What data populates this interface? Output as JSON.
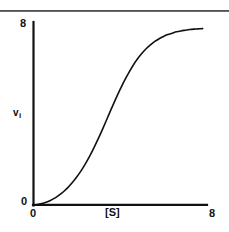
{
  "figure": {
    "background": "#ffffff",
    "ink": "#111111",
    "rule_color": "#6b6b6b"
  },
  "top_rule": {
    "name": "page-rule"
  },
  "axes": {
    "x_label": "[S]",
    "y_label_base": "v",
    "y_label_sub": "i",
    "x_tick_min": "0",
    "x_tick_max": "8",
    "y_tick_min": "0",
    "y_tick_max": "8",
    "origin_label": "0"
  },
  "chart_data": {
    "type": "line",
    "title": "",
    "subtitle": "",
    "xlabel": "[S]",
    "ylabel": "v_i",
    "xlim": [
      0,
      8
    ],
    "ylim": [
      0,
      8
    ],
    "xticks": [
      0,
      8
    ],
    "yticks": [
      0,
      8
    ],
    "xticklabels": [
      "0",
      "8"
    ],
    "yticklabels": [
      "0",
      "8"
    ],
    "grid": false,
    "legend": null,
    "legend_position": "none",
    "annotations": [],
    "series": [
      {
        "name": "sigmoidal velocity curve",
        "color": "#111111",
        "line_width": 1.6,
        "marker": "none",
        "description": "S-shaped (sigmoidal) cooperative saturation curve rising from the origin, inflecting near [S]=4, plateauing near v=7.7",
        "x": [
          0.0,
          0.2,
          0.4,
          0.6,
          0.8,
          1.0,
          1.2,
          1.4,
          1.6,
          1.8,
          2.0,
          2.2,
          2.4,
          2.6,
          2.8,
          3.0,
          3.2,
          3.4,
          3.6,
          3.8,
          4.0,
          4.2,
          4.4,
          4.6,
          4.8,
          5.0,
          5.2,
          5.4,
          5.6,
          5.8,
          6.0,
          6.2,
          6.4,
          6.6,
          6.8,
          7.0,
          7.2,
          7.4,
          7.6,
          7.8
        ],
        "y": [
          0.0,
          0.02,
          0.06,
          0.12,
          0.2,
          0.3,
          0.43,
          0.58,
          0.76,
          0.97,
          1.21,
          1.48,
          1.79,
          2.13,
          2.5,
          2.9,
          3.32,
          3.76,
          4.2,
          4.63,
          5.04,
          5.43,
          5.78,
          6.1,
          6.38,
          6.62,
          6.83,
          7.0,
          7.15,
          7.27,
          7.37,
          7.45,
          7.51,
          7.57,
          7.61,
          7.64,
          7.67,
          7.69,
          7.7,
          7.71
        ]
      }
    ]
  },
  "geometry": {
    "plot_left_px": 33,
    "plot_right_px": 207,
    "plot_top_px": 22,
    "plot_bottom_px": 205
  }
}
